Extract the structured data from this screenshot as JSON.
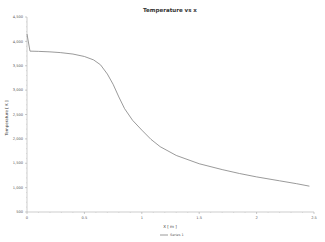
{
  "chart_data": {
    "type": "line",
    "title": "Temperature vs x",
    "xlabel": "X [ m ]",
    "ylabel": "Temperature [ K ]",
    "xlim": [
      0,
      2.5
    ],
    "ylim": [
      500,
      4500
    ],
    "xticks": [
      0,
      0.5,
      1,
      1.5,
      2,
      2.5
    ],
    "xtick_labels": [
      "0",
      "0.5",
      "1",
      "1.5",
      "2",
      "2.5"
    ],
    "yticks": [
      500,
      1000,
      1500,
      2000,
      2500,
      3000,
      3500,
      4000,
      4500
    ],
    "ytick_labels": [
      "500",
      "1,000",
      "1,500",
      "2,000",
      "2,500",
      "3,000",
      "3,500",
      "4,000",
      "4,500"
    ],
    "grid": false,
    "legend": {
      "position": "bottom-center",
      "entries": [
        "Series 1"
      ]
    },
    "series": [
      {
        "name": "Series 1",
        "color": "#808080",
        "x": [
          0,
          0.026,
          0.1,
          0.2,
          0.29,
          0.4,
          0.5,
          0.58,
          0.64,
          0.7,
          0.75,
          0.8,
          0.85,
          0.92,
          1.0,
          1.08,
          1.16,
          1.3,
          1.5,
          1.7,
          1.85,
          2.0,
          2.2,
          2.35,
          2.46
        ],
        "y": [
          4150,
          3800,
          3795,
          3785,
          3770,
          3740,
          3690,
          3620,
          3520,
          3330,
          3120,
          2860,
          2620,
          2380,
          2180,
          1990,
          1840,
          1660,
          1490,
          1370,
          1290,
          1220,
          1140,
          1080,
          1030
        ]
      }
    ]
  }
}
